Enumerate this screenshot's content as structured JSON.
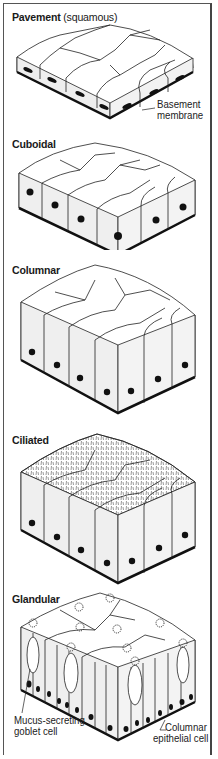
{
  "figure": {
    "panels": [
      {
        "id": "pavement",
        "title": "Pavement",
        "subtitle": "(squamous)",
        "labels": [
          "Basement",
          "membrane"
        ]
      },
      {
        "id": "cuboidal",
        "title": "Cuboidal"
      },
      {
        "id": "columnar",
        "title": "Columnar"
      },
      {
        "id": "ciliated",
        "title": "Ciliated"
      },
      {
        "id": "glandular",
        "title": "Glandular",
        "labels": [
          "Mucus-secreting",
          "goblet cell",
          "Columnar",
          "epithelial cell"
        ]
      }
    ]
  },
  "colors": {
    "line": "#222222",
    "side": "#f0f0f0",
    "top": "#ffffff",
    "nucleus": "#111111",
    "membrane": "#111111"
  }
}
